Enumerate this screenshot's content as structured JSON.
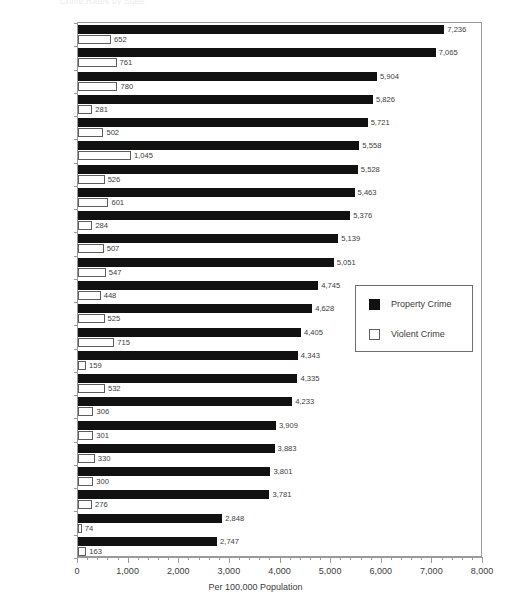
{
  "chart_title": "Crime Rates by State",
  "axis": {
    "xlabel": "Per 100,000 Population",
    "xticks": [
      "0",
      "1,000",
      "2,000",
      "3,000",
      "4,000",
      "5,000",
      "6,000",
      "7,000",
      "8,000"
    ]
  },
  "legend": {
    "items": [
      {
        "label": "Property Crime",
        "swatch": "filled-black-square"
      },
      {
        "label": "Violent Crime",
        "swatch": "hollow-white-square"
      }
    ]
  },
  "chart_data": {
    "type": "bar",
    "orientation": "horizontal",
    "title": "Crime Rates by State",
    "xlabel": "Per 100,000 Population",
    "ylabel": "",
    "xlim": [
      0,
      8000
    ],
    "xtick_step": 1000,
    "xtick_minor_step": 200,
    "grid": false,
    "legend_position": "center-right",
    "categories": [
      "Arizona",
      "Texas",
      "New Mexico",
      "Hawaii",
      "Washington",
      "California",
      "Colorado",
      "Nevada",
      "Utah",
      "Oregon",
      "Oklahoma",
      "Kansas",
      "Alaska",
      "Missouri",
      "Montana",
      "Arkansas",
      "Minnesota",
      "Wyoming",
      "Nebraska",
      "Iowa",
      "Idaho",
      "North Dakota",
      "South Dakota"
    ],
    "series": [
      {
        "name": "Property Crime",
        "color": "#111111",
        "values": [
          7236,
          7065,
          5904,
          5826,
          5721,
          5558,
          5528,
          5463,
          5376,
          5139,
          5051,
          4745,
          4628,
          4405,
          4343,
          4335,
          4233,
          3909,
          3883,
          3801,
          3781,
          2848,
          2747
        ],
        "labels": [
          "7,236",
          "7,065",
          "5,904",
          "5,826",
          "5,721",
          "5,558",
          "5,528",
          "5,463",
          "5,376",
          "5,139",
          "5,051",
          "4,745",
          "4,628",
          "4,405",
          "4,343",
          "4,335",
          "4,233",
          "3,909",
          "3,883",
          "3,801",
          "3,781",
          "2,848",
          "2,747"
        ]
      },
      {
        "name": "Violent Crime",
        "color": "#ffffff",
        "values": [
          652,
          761,
          780,
          281,
          502,
          1045,
          526,
          601,
          284,
          507,
          547,
          448,
          525,
          715,
          159,
          532,
          306,
          301,
          330,
          300,
          276,
          74,
          163
        ],
        "labels": [
          "652",
          "761",
          "780",
          "281",
          "502",
          "1,045",
          "526",
          "601",
          "284",
          "507",
          "547",
          "448",
          "525",
          "715",
          "159",
          "532",
          "306",
          "301",
          "330",
          "300",
          "276",
          "74",
          "163"
        ]
      }
    ]
  }
}
